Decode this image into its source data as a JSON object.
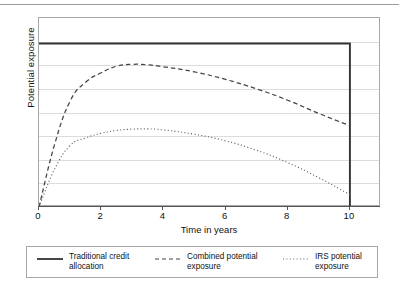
{
  "figure": {
    "top_rule": "horizontal-rule"
  },
  "chart_data": {
    "type": "line",
    "title": "",
    "xlabel": "Time in years",
    "ylabel": "Potential exposure",
    "xlim": [
      0,
      11
    ],
    "ylim": [
      0,
      1
    ],
    "xticks": [
      "0",
      "2",
      "4",
      "6",
      "8",
      "10"
    ],
    "xtick_values": [
      0,
      2,
      4,
      6,
      8,
      10
    ],
    "yticks": [],
    "grid": "horizontal",
    "legend_position": "below",
    "series": [
      {
        "name": "Traditional credit allocation",
        "style": "solid",
        "color": "#333333",
        "x": [
          0,
          10,
          10
        ],
        "y": [
          0.865,
          0.865,
          0.0
        ]
      },
      {
        "name": "Combined potential exposure",
        "style": "dashed",
        "color": "#444444",
        "x": [
          0,
          0.5,
          1,
          1.5,
          2,
          2.5,
          3,
          3.5,
          4,
          5,
          6,
          7,
          8,
          9,
          10
        ],
        "y": [
          0.0,
          0.33,
          0.56,
          0.66,
          0.71,
          0.745,
          0.755,
          0.752,
          0.742,
          0.715,
          0.675,
          0.625,
          0.565,
          0.495,
          0.43
        ]
      },
      {
        "name": "IRS potential exposure",
        "style": "dotted",
        "color": "#666666",
        "x": [
          0,
          0.5,
          1,
          1.5,
          2,
          2.5,
          3,
          3.5,
          4,
          5,
          6,
          7,
          8,
          9,
          10
        ],
        "y": [
          0.0,
          0.2,
          0.325,
          0.365,
          0.39,
          0.405,
          0.412,
          0.413,
          0.408,
          0.385,
          0.35,
          0.3,
          0.235,
          0.155,
          0.065
        ]
      }
    ]
  },
  "legend": {
    "entries": [
      {
        "label": "Traditional credit\nallocation",
        "style": "solid"
      },
      {
        "label": "Combined potential\nexposure",
        "style": "dashed"
      },
      {
        "label": "IRS potential\nexposure",
        "style": "dotted"
      }
    ]
  },
  "colors": {
    "frame": "#a8a8a8",
    "grid": "#dcdcdc",
    "axis": "#555555",
    "text": "#111111",
    "rule": "#9a9a9a"
  }
}
